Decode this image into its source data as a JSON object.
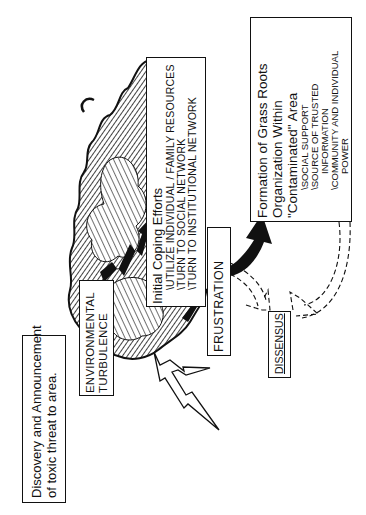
{
  "diagram": {
    "orientation": "rotated-90-ccw",
    "nodes": {
      "discovery": {
        "lines": [
          "Discovery  and  Announcement",
          "of  toxic  threat  to  area."
        ]
      },
      "environmental_turbulence": {
        "lines": [
          "ENVIRONMENTAL",
          "TURBULENCE"
        ]
      },
      "initial_coping": {
        "title": "Initial  Coping  Efforts",
        "items": [
          "\\UTILIZE  INDIVIDUAL / FAMILY  RESOURCES",
          "\\TURN  TO  SOCIAL  NETWORK",
          "\\TURN  TO  INSTITUTIONAL  NETWORK"
        ]
      },
      "frustration": {
        "label": "FRUSTRATION"
      },
      "grass_roots": {
        "title_lines": [
          "Formation  of  Grass  Roots",
          "Organization  Within",
          "\"Contaminated\"  Area"
        ],
        "items": [
          "\\SOCIAL  SUPPORT",
          "\\SOURCE  OF  TRUSTED",
          "INFORMATION",
          "\\COMMUNITY  AND  INDIVIDUAL",
          "POWER"
        ]
      },
      "dissensus": {
        "label": "DISSENSUS"
      }
    },
    "edges": [
      {
        "from": "environmental_turbulence",
        "to": "initial_coping",
        "style": "solid-zigzag-arrow"
      },
      {
        "from": "initial_coping",
        "to": "frustration",
        "style": "solid-arrow"
      },
      {
        "from": "frustration",
        "to": "grass_roots",
        "style": "solid-curved-arrow"
      },
      {
        "from": "frustration",
        "to": "dissensus",
        "style": "dashed-curved-arrow"
      },
      {
        "from": "grass_roots",
        "to": "dissensus",
        "style": "dashed-curved-arrow"
      }
    ],
    "decorations": [
      "storm-cloud",
      "lightning-bolt"
    ],
    "colors": {
      "ink": "#111111",
      "paper": "#ffffff"
    }
  }
}
